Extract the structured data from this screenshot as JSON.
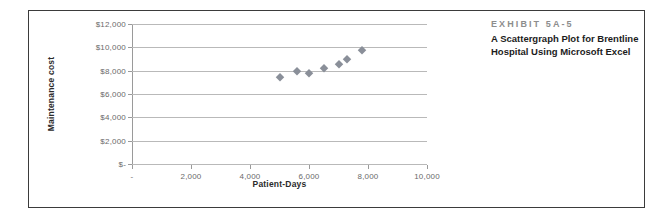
{
  "exhibit": {
    "number": "EXHIBIT 5A-5",
    "caption_lines": [
      "A Scattergraph Plot for Brentline",
      "Hospital Using Microsoft Excel"
    ]
  },
  "chart_data": {
    "type": "scatter",
    "title": "",
    "xlabel": "Patient-Days",
    "ylabel": "Maintenance cost",
    "xlim": [
      0,
      10000
    ],
    "ylim": [
      0,
      12000
    ],
    "grid": true,
    "legend": "none",
    "marker_color": "#8a8f99",
    "marker_shape": "diamond",
    "x_tick_labels": [
      "-",
      "2,000",
      "4,000",
      "6,000",
      "8,000",
      "10,000"
    ],
    "x_tick_values": [
      0,
      2000,
      4000,
      6000,
      8000,
      10000
    ],
    "y_tick_labels": [
      "$-",
      "$2,000",
      "$4,000",
      "$6,000",
      "$8,000",
      "$10,000",
      "$12,000"
    ],
    "y_tick_values": [
      0,
      2000,
      4000,
      6000,
      8000,
      10000,
      12000
    ],
    "points": [
      {
        "x": 5000,
        "y": 7500
      },
      {
        "x": 5600,
        "y": 8000
      },
      {
        "x": 6000,
        "y": 7800
      },
      {
        "x": 6500,
        "y": 8200
      },
      {
        "x": 7000,
        "y": 8600
      },
      {
        "x": 7300,
        "y": 9000
      },
      {
        "x": 7800,
        "y": 9800
      }
    ]
  }
}
